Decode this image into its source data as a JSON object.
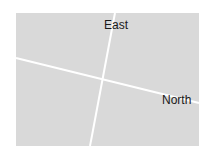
{
  "diagram": {
    "background_color": "#ffffff",
    "panel": {
      "x": 16,
      "y": 13,
      "width": 183,
      "height": 133,
      "color": "#d9d9d9"
    },
    "axes": [
      {
        "label": "East",
        "x1": 115,
        "y1": 13,
        "x2": 90,
        "y2": 146,
        "label_x": 104,
        "label_y": 29
      },
      {
        "label": "North",
        "x1": 16,
        "y1": 58,
        "x2": 199,
        "y2": 103,
        "label_x": 162,
        "label_y": 104
      }
    ],
    "line_color": "#ffffff"
  }
}
